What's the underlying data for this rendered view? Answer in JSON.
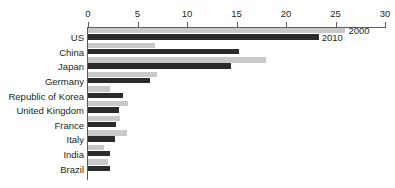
{
  "chart_data": {
    "type": "bar",
    "orientation": "horizontal",
    "title": "",
    "xlabel": "",
    "ylabel": "",
    "xlim": [
      0,
      30
    ],
    "xticks": [
      0,
      5,
      10,
      15,
      20,
      25,
      30
    ],
    "xtick_labels": [
      "0",
      "5",
      "10",
      "15",
      "20",
      "25",
      "30"
    ],
    "grid": false,
    "legend_position": "inline-annotation-top-right",
    "categories": [
      "US",
      "China",
      "Japan",
      "Germany",
      "Republic of Korea",
      "United Kingdom",
      "France",
      "Italy",
      "India",
      "Brazil"
    ],
    "series": [
      {
        "name": "2000",
        "color": "#c9c9c9",
        "values": [
          26.0,
          6.8,
          18.0,
          7.0,
          2.2,
          4.0,
          3.2,
          3.9,
          1.6,
          2.0
        ]
      },
      {
        "name": "2010",
        "color": "#2b2b2b",
        "values": [
          23.3,
          15.3,
          14.4,
          6.3,
          3.5,
          3.1,
          2.8,
          2.7,
          2.2,
          2.2
        ]
      }
    ],
    "annotations": [
      {
        "text": "2000",
        "series": "2000"
      },
      {
        "text": "2010",
        "series": "2010"
      }
    ]
  },
  "colors": {
    "series_2000": "#c9c9c9",
    "series_2010": "#2b2b2b",
    "axis": "#5a5a5a",
    "text": "#231f20",
    "background": "#ffffff"
  }
}
